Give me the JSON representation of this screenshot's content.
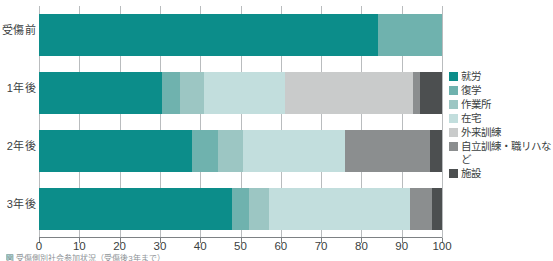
{
  "chart_data": {
    "type": "bar",
    "orientation": "horizontal",
    "stacked": true,
    "title": "",
    "xlabel": "",
    "ylabel": "",
    "xlim": [
      0,
      100
    ],
    "xticks": [
      0,
      10,
      20,
      30,
      40,
      50,
      60,
      70,
      80,
      90,
      100
    ],
    "xtick_labels": [
      "0",
      "10",
      "20",
      "30",
      "40",
      "50",
      "60",
      "70",
      "80",
      "90",
      "100"
    ],
    "grid": true,
    "legend_position": "right",
    "categories": [
      "受傷前",
      "1年後",
      "2年後",
      "3年後"
    ],
    "series": [
      {
        "name": "就労",
        "color": "#0c8d8a",
        "values": [
          84.0,
          30.5,
          38.0,
          48.0
        ]
      },
      {
        "name": "復学",
        "color": "#6fb2ae",
        "values": [
          16.0,
          4.5,
          6.5,
          4.0
        ]
      },
      {
        "name": "作業所",
        "color": "#9cc6c3",
        "values": [
          0.0,
          6.0,
          6.0,
          5.0
        ]
      },
      {
        "name": "在宅",
        "color": "#c2dedd",
        "values": [
          0.0,
          20.0,
          25.5,
          35.0
        ]
      },
      {
        "name": "外来訓練",
        "color": "#c9cbcb",
        "values": [
          0.0,
          31.8,
          0.0,
          0.0
        ]
      },
      {
        "name": "自立訓練・職リハなど",
        "color": "#8b8e8f",
        "values": [
          0.0,
          1.7,
          21.0,
          5.5
        ]
      },
      {
        "name": "施設",
        "color": "#4c4f50",
        "values": [
          0.0,
          5.5,
          3.0,
          2.5
        ]
      }
    ]
  },
  "axis": {
    "x_tick_labels": [
      "0",
      "10",
      "20",
      "30",
      "40",
      "50",
      "60",
      "70",
      "80",
      "90",
      "100"
    ],
    "y_tick_labels": [
      "受傷前",
      "1年後",
      "2年後",
      "3年後"
    ]
  },
  "legend": {
    "items": [
      {
        "label": "就労",
        "color": "#0c8d8a"
      },
      {
        "label": "復学",
        "color": "#6fb2ae"
      },
      {
        "label": "作業所",
        "color": "#9cc6c3"
      },
      {
        "label": "在宅",
        "color": "#c2dedd"
      },
      {
        "label": "外来訓練",
        "color": "#c9cbcb"
      },
      {
        "label": "自立訓練・職リハなど",
        "color": "#8b8e8f"
      },
      {
        "label": "施設",
        "color": "#4c4f50"
      }
    ]
  },
  "caption": {
    "text": "図 受傷側別社会参加状況（受傷後3年まで）"
  },
  "colors": {
    "grid": "#b9bcbe",
    "axis": "#7d8184",
    "text": "#3b3f42",
    "background": "#ffffff"
  }
}
